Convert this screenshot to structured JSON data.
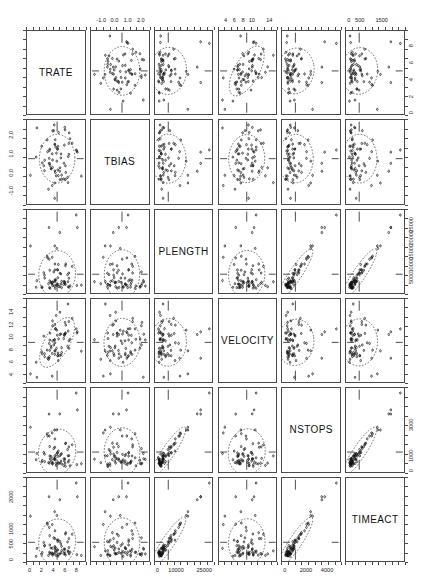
{
  "figure": {
    "type": "scatterplot-matrix",
    "title": "",
    "n_variables": 6,
    "background": "#ffffff",
    "frame_color": "#4a4a4a",
    "point_color": "#111111",
    "ellipse_style": "dashed"
  },
  "chart_data": {
    "type": "scatter",
    "title": "",
    "xlabel": "",
    "ylabel": "",
    "grid": false,
    "legend_position": "none",
    "matrix_layout": "6x6 pairwise scatterplot matrix (SPLOM), diagonal shows variable name",
    "variables": [
      {
        "name": "TRATE",
        "index": 0,
        "range": [
          0,
          9
        ],
        "ticks": [
          0,
          2,
          4,
          6,
          8
        ],
        "tick_labels": [
          "0",
          "2",
          "4",
          "6",
          "8"
        ],
        "axis_side_x": "bottom",
        "axis_side_y": "right"
      },
      {
        "name": "TBIAS",
        "index": 1,
        "range": [
          -1.6,
          2.4
        ],
        "ticks": [
          -1.0,
          0.0,
          1.0,
          2.0
        ],
        "tick_labels": [
          "-1.0",
          "0.0",
          "1.0",
          "2.0"
        ],
        "axis_side_x": "top",
        "axis_side_y": "left"
      },
      {
        "name": "PLENGTH",
        "index": 2,
        "range": [
          0,
          28000
        ],
        "ticks": [
          0,
          10000,
          25000
        ],
        "tick_labels": [
          "0",
          "10000",
          "25000"
        ],
        "right_ticks": [
          5000,
          10000,
          15000,
          20000,
          25000
        ],
        "right_tick_labels": [
          "5000",
          "10000",
          "15000",
          "20000",
          "25000"
        ],
        "axis_side_x": "bottom",
        "axis_side_y": "right"
      },
      {
        "name": "VELOCITY",
        "index": 3,
        "range": [
          3,
          15
        ],
        "ticks": [
          4,
          6,
          8,
          10,
          12,
          14
        ],
        "tick_labels": [
          "4",
          "6",
          "8",
          "10",
          "12",
          "14"
        ],
        "top_ticks": [
          4,
          6,
          8,
          10,
          14
        ],
        "top_tick_labels": [
          "4",
          "6",
          "8",
          "10",
          "14"
        ],
        "axis_side_x": "top",
        "axis_side_y": "left"
      },
      {
        "name": "NSTOPS",
        "index": 4,
        "range": [
          0,
          5000
        ],
        "ticks": [
          0,
          2000,
          4000
        ],
        "tick_labels": [
          "0",
          "2000",
          "4000"
        ],
        "right_ticks": [
          0,
          1000,
          3000
        ],
        "right_tick_labels": [
          "0",
          "1000",
          "3000"
        ],
        "axis_side_x": "bottom",
        "axis_side_y": "right"
      },
      {
        "name": "TIMEACT",
        "index": 5,
        "range": [
          0,
          2400
        ],
        "ticks": [
          0,
          500,
          1500
        ],
        "tick_labels": [
          "0",
          "500",
          "1500"
        ],
        "left_ticks": [
          0,
          500,
          1000,
          2000
        ],
        "left_tick_labels": [
          "0",
          "500",
          "1000",
          "2000"
        ],
        "axis_side_x": "top",
        "axis_side_y": "left"
      }
    ],
    "correlations": [
      [
        1.0,
        0.05,
        0.12,
        0.62,
        0.18,
        0.14
      ],
      [
        0.05,
        1.0,
        0.04,
        0.08,
        0.06,
        0.05
      ],
      [
        0.12,
        0.04,
        1.0,
        0.1,
        0.93,
        0.95
      ],
      [
        0.62,
        0.08,
        0.1,
        1.0,
        0.15,
        0.12
      ],
      [
        0.18,
        0.06,
        0.93,
        0.15,
        1.0,
        0.9
      ],
      [
        0.14,
        0.05,
        0.95,
        0.12,
        0.9,
        1.0
      ]
    ],
    "n_points": 70
  }
}
